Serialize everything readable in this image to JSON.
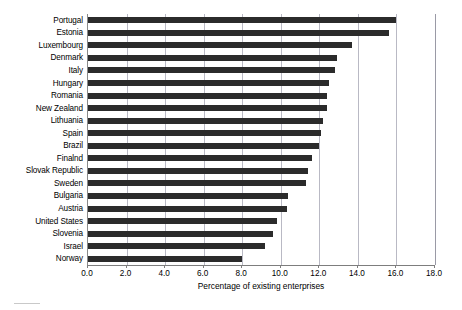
{
  "chart_data": {
    "type": "bar",
    "orientation": "horizontal",
    "title": "",
    "subtitle": "",
    "xlabel": "Percentage of existing enterprises",
    "ylabel": "",
    "xlim": [
      0.0,
      18.0
    ],
    "xticks": [
      "0.0",
      "2.0",
      "4.0",
      "6.0",
      "8.0",
      "10.0",
      "12.0",
      "14.0",
      "16.0",
      "18.0"
    ],
    "xtick_values": [
      0.0,
      2.0,
      4.0,
      6.0,
      8.0,
      10.0,
      12.0,
      14.0,
      16.0,
      18.0
    ],
    "grid": "vertical",
    "legend": "none",
    "bar_color": "#2b2b2b",
    "grid_color": "#b9b9c4",
    "axis_color": "#7d7d7d",
    "categories": [
      "Portugal",
      "Estonia",
      "Luxembourg",
      "Denmark",
      "Italy",
      "Hungary",
      "Romania",
      "New Zealand",
      "Lithuania",
      "Spain",
      "Brazil",
      "Finalnd",
      "Slovak Republic",
      "Sweden",
      "Bulgaria",
      "Austria",
      "United States",
      "Slovenia",
      "Israel",
      "Norway"
    ],
    "values": [
      16.0,
      15.6,
      13.7,
      12.9,
      12.8,
      12.5,
      12.4,
      12.4,
      12.2,
      12.1,
      12.0,
      11.6,
      11.4,
      11.3,
      10.4,
      10.3,
      9.8,
      9.6,
      9.2,
      8.0
    ]
  }
}
